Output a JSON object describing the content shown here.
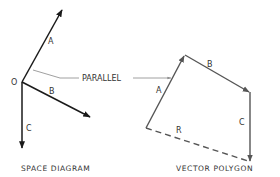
{
  "diagram": {
    "colors": {
      "ink": "#1a1a1a",
      "leader": "#888888",
      "polygon": "#555555",
      "text": "#333333"
    },
    "space_diagram": {
      "caption": "SPACE DIAGRAM",
      "origin_label": "O",
      "vectors": [
        {
          "label": "A",
          "direction": "up-right"
        },
        {
          "label": "B",
          "direction": "down-right"
        },
        {
          "label": "C",
          "direction": "down"
        }
      ]
    },
    "leader": {
      "label": "PARALLEL"
    },
    "vector_polygon": {
      "caption": "VECTOR POLYGON",
      "sides": [
        {
          "label": "A",
          "style": "solid"
        },
        {
          "label": "B",
          "style": "solid"
        },
        {
          "label": "C",
          "style": "solid"
        },
        {
          "label": "R",
          "style": "dashed",
          "meaning": "resultant"
        }
      ]
    }
  }
}
